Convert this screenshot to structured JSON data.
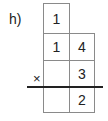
{
  "problem": {
    "label": "h)",
    "operator": "×",
    "carry": "1",
    "multiplicand": [
      "1",
      "4"
    ],
    "multiplier": [
      "",
      "3"
    ],
    "result": [
      "",
      "2"
    ]
  }
}
